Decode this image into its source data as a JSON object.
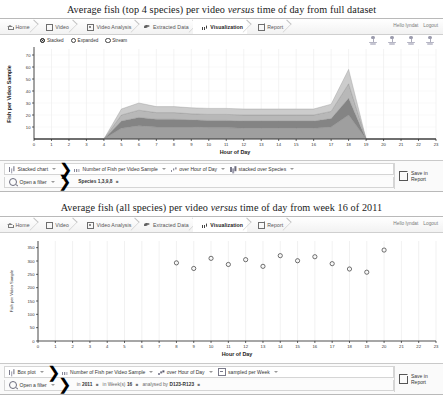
{
  "panels": [
    {
      "figure_title_pre": "Average fish (top 4 species) per video ",
      "figure_title_em": "versus",
      "figure_title_post": " time of day from full dataset",
      "nav": {
        "items": [
          {
            "label": "Home",
            "icon": "home-icon",
            "active": false
          },
          {
            "label": "Video",
            "icon": "video-square-icon",
            "active": false
          },
          {
            "label": "Video Analysis",
            "icon": "video-analysis-icon",
            "active": false
          },
          {
            "label": "Extracted Data",
            "icon": "fish-icon",
            "active": false
          },
          {
            "label": "Visualization",
            "icon": "bar-chart-icon",
            "active": true
          },
          {
            "label": "Report",
            "icon": "report-icon",
            "active": false
          }
        ],
        "greeting": "Hello lyndat",
        "logout": "Logout"
      },
      "legend": {
        "options": [
          {
            "label": "Stacked",
            "selected": true
          },
          {
            "label": "Expanded",
            "selected": false
          },
          {
            "label": "Stream",
            "selected": false
          }
        ]
      },
      "controls": {
        "row1": [
          {
            "label": "Stacked chart",
            "icon": "bar-chart-icon"
          },
          {
            "label": "Number of Fish per Video Sample",
            "icon": "bars-icon"
          },
          {
            "label": "over Hour of Day",
            "icon": "bars-group-icon"
          },
          {
            "label": "stacked over Species",
            "icon": "stacked-bars-icon"
          }
        ],
        "row2_label": "Open a filter",
        "row2_chips": [
          {
            "pre": "",
            "value": "Species 1,3,9,8"
          }
        ],
        "save_line1": "Save in",
        "save_line2": "Report"
      },
      "chart_data": {
        "type": "area",
        "title": "Average fish (top 4 species) per video versus time of day from full dataset",
        "xlabel": "Hour of Day",
        "ylabel": "Fish per Video Sample",
        "xlim": [
          0,
          23
        ],
        "ylim": [
          0,
          75
        ],
        "yticks": [
          10,
          20,
          30,
          40,
          50,
          60,
          70
        ],
        "xticks": [
          0,
          1,
          2,
          3,
          4,
          5,
          6,
          7,
          8,
          9,
          10,
          11,
          12,
          13,
          14,
          15,
          16,
          17,
          18,
          19,
          20,
          21,
          22,
          23
        ],
        "grid": true,
        "stack_mode": "stacked",
        "x": [
          0,
          1,
          2,
          3,
          4,
          5,
          6,
          7,
          8,
          9,
          10,
          11,
          12,
          13,
          14,
          15,
          16,
          17,
          18,
          19,
          20,
          21,
          22,
          23
        ],
        "series": [
          {
            "name": "Species 1",
            "color": "#9a9a9a",
            "values": [
              0,
              0,
              0,
              0,
              0,
              9,
              11,
              10,
              10,
              10,
              9.5,
              9.5,
              9,
              9,
              9,
              9,
              9,
              10,
              20,
              0,
              0,
              0,
              0,
              0
            ]
          },
          {
            "name": "Species 3",
            "color": "#7d7d7d",
            "values": [
              0,
              0,
              0,
              0,
              0,
              6,
              7,
              6.5,
              6.5,
              6,
              6,
              6,
              6,
              6,
              6,
              6,
              6,
              7,
              14,
              0,
              0,
              0,
              0,
              0
            ]
          },
          {
            "name": "Species 9",
            "color": "#b4b4b4",
            "values": [
              0,
              0,
              0,
              0,
              0,
              5,
              6,
              5.5,
              5.5,
              5,
              5,
              5,
              5,
              5,
              5,
              5,
              5,
              6,
              12,
              0,
              0,
              0,
              0,
              0
            ]
          },
          {
            "name": "Species 8",
            "color": "#c9c9c9",
            "values": [
              0,
              0,
              0,
              0,
              0,
              5,
              6,
              5,
              5,
              5,
              5,
              5,
              5,
              5,
              5,
              5,
              5,
              6,
              12,
              0,
              0,
              0,
              0,
              0
            ]
          }
        ]
      }
    },
    {
      "figure_title_pre": "Average fish (all species) per video ",
      "figure_title_em": "versus",
      "figure_title_post": " time of day from week 16 of 2011",
      "nav": {
        "items": [
          {
            "label": "Home",
            "icon": "home-icon",
            "active": false
          },
          {
            "label": "Video",
            "icon": "video-square-icon",
            "active": false
          },
          {
            "label": "Video Analysis",
            "icon": "video-analysis-icon",
            "active": false
          },
          {
            "label": "Extracted Data",
            "icon": "fish-icon",
            "active": false
          },
          {
            "label": "Visualization",
            "icon": "bar-chart-icon",
            "active": true
          },
          {
            "label": "Report",
            "icon": "report-icon",
            "active": false
          }
        ],
        "greeting": "Hello lyndat",
        "logout": "Logout"
      },
      "controls": {
        "row1": [
          {
            "label": "Box plot",
            "icon": "bars-icon"
          },
          {
            "label": "Number of Fish per Video Sample",
            "icon": "bars-icon"
          },
          {
            "label": "over Hour of Day",
            "icon": "bars-group-icon"
          },
          {
            "label": "sampled per Week",
            "icon": "box-icon"
          }
        ],
        "row2_label": "Open a filter",
        "row2_chips": [
          {
            "pre": "in",
            "value": "2011"
          },
          {
            "pre": "in Week(s)",
            "value": "16"
          },
          {
            "pre": "analysed by",
            "value": "D123-R123"
          }
        ],
        "save_line1": "Save in",
        "save_line2": "Report"
      },
      "chart_data": {
        "type": "scatter",
        "title": "Average fish (all species) per video versus time of day from week 16 of 2011",
        "xlabel": "Hour of Day",
        "ylabel": "Fish per Video Sample",
        "xlim": [
          0,
          23
        ],
        "ylim": [
          0,
          375
        ],
        "yticks": [
          0,
          50,
          100,
          150,
          200,
          250,
          300,
          350
        ],
        "xticks": [
          0,
          1,
          2,
          3,
          4,
          5,
          6,
          7,
          8,
          9,
          10,
          11,
          12,
          13,
          14,
          15,
          16,
          17,
          18,
          19,
          20,
          21,
          22,
          23
        ],
        "grid": true,
        "points": [
          {
            "x": 8,
            "y": 293
          },
          {
            "x": 9,
            "y": 272
          },
          {
            "x": 10,
            "y": 310
          },
          {
            "x": 11,
            "y": 287
          },
          {
            "x": 12,
            "y": 305
          },
          {
            "x": 13,
            "y": 280
          },
          {
            "x": 14,
            "y": 320
          },
          {
            "x": 15,
            "y": 301
          },
          {
            "x": 16,
            "y": 316
          },
          {
            "x": 17,
            "y": 290
          },
          {
            "x": 18,
            "y": 270
          },
          {
            "x": 19,
            "y": 258
          },
          {
            "x": 20,
            "y": 341
          }
        ]
      }
    }
  ]
}
